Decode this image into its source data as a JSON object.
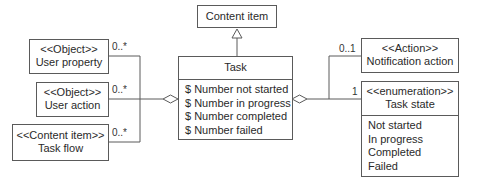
{
  "classes": {
    "content_item": {
      "name": "Content item"
    },
    "task": {
      "name": "Task",
      "attributes": [
        "$ Number not started",
        "$ Number in progress",
        "$ Number completed",
        "$ Number failed"
      ]
    },
    "user_property": {
      "stereotype": "<<Object>>",
      "name": "User property"
    },
    "user_action": {
      "stereotype": "<<Object>>",
      "name": "User action"
    },
    "task_flow": {
      "stereotype": "<<Content item>>",
      "name": "Task flow"
    },
    "notification_action": {
      "stereotype": "<<Action>>",
      "name": "Notification action"
    },
    "task_state": {
      "stereotype": "<<enumeration>>",
      "name": "Task state",
      "values": [
        "Not started",
        "In progress",
        "Completed",
        "Failed"
      ]
    }
  },
  "multiplicities": {
    "user_property": "0..*",
    "user_action": "0..*",
    "task_flow": "0..*",
    "notification_action": "0..1",
    "task_state": "1"
  },
  "colors": {
    "line": "#5a5a5a",
    "text": "#2a2a2a",
    "background": "#ffffff"
  }
}
